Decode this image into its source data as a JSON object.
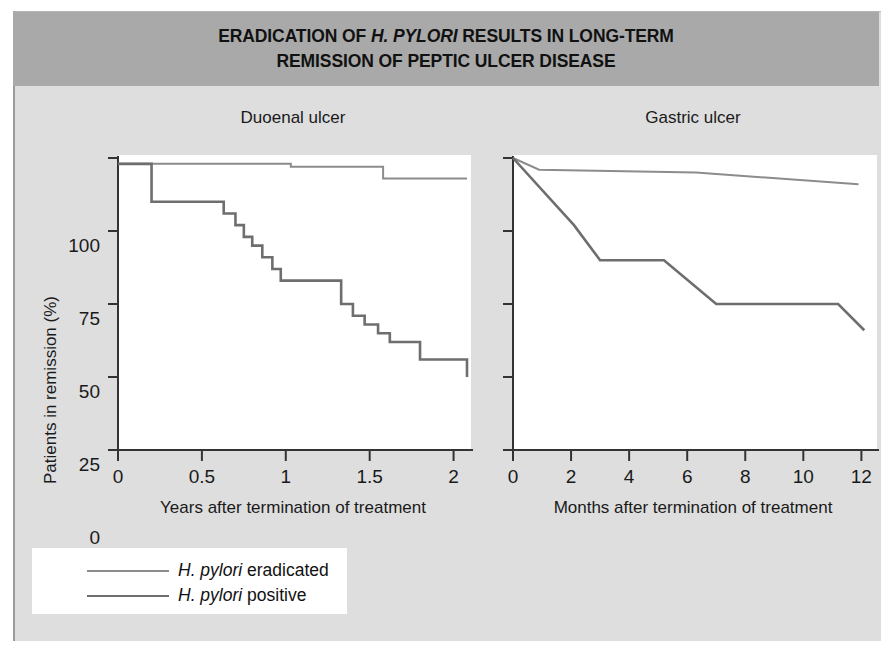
{
  "figure": {
    "title_line1_pre": "ERADICATION OF ",
    "title_line1_italic": "H. PYLORI",
    "title_line1_post": " RESULTS IN LONG-TERM",
    "title_line2": "REMISSION OF PEPTIC ULCER DISEASE",
    "background_color": "#dedede",
    "header_color": "#a9a9a9",
    "plot_background": "#ffffff"
  },
  "legend": {
    "items": [
      {
        "label_italic": "H. pylori",
        "label_rest": " eradicated",
        "color": "#8c8c8c",
        "width": 2
      },
      {
        "label_italic": "H. pylori",
        "label_rest": " positive",
        "color": "#6e6e6e",
        "width": 2.6
      }
    ]
  },
  "chart_data": [
    {
      "type": "line",
      "title": "Duoenal ulcer",
      "xlabel": "Years after termination of treatment",
      "ylabel": "Patients in remission (%)",
      "xlim": [
        0,
        2.08
      ],
      "ylim": [
        0,
        100
      ],
      "xticks": [
        0,
        0.5,
        1,
        1.5,
        2
      ],
      "xticklabels": [
        "0",
        "0.5",
        "1",
        "1.5",
        "2"
      ],
      "yticks": [
        0,
        25,
        50,
        75,
        100
      ],
      "yticklabels": [
        "0",
        "25",
        "50",
        "75",
        "100"
      ],
      "grid": false,
      "step": "post",
      "series": [
        {
          "name": "H. pylori eradicated",
          "color": "#8c8c8c",
          "x": [
            0,
            1.03,
            1.58,
            2.08
          ],
          "y": [
            98,
            97,
            93,
            93
          ]
        },
        {
          "name": "H. pylori positive",
          "color": "#6e6e6e",
          "x": [
            0,
            0.2,
            0.55,
            0.63,
            0.7,
            0.75,
            0.8,
            0.86,
            0.92,
            0.97,
            1.33,
            1.4,
            1.47,
            1.55,
            1.62,
            1.8,
            2.08
          ],
          "y": [
            98,
            85,
            85,
            81,
            77,
            73,
            70,
            66,
            62,
            58,
            50,
            46,
            43,
            40,
            37,
            31,
            25
          ]
        }
      ]
    },
    {
      "type": "line",
      "title": "Gastric ulcer",
      "xlabel": "Months after termination of treatment",
      "ylabel": "Patients in remission (%)",
      "xlim": [
        0,
        12.4
      ],
      "ylim": [
        0,
        100
      ],
      "xticks": [
        0,
        2,
        4,
        6,
        8,
        10,
        12
      ],
      "xticklabels": [
        "0",
        "2",
        "4",
        "6",
        "8",
        "10",
        "12"
      ],
      "yticks": [
        0,
        25,
        50,
        75,
        100
      ],
      "grid": false,
      "step": "none",
      "series": [
        {
          "name": "H. pylori eradicated",
          "color": "#8c8c8c",
          "x": [
            0,
            0.9,
            6.3,
            11.9
          ],
          "y": [
            100,
            96,
            95,
            91
          ]
        },
        {
          "name": "H. pylori positive",
          "color": "#6e6e6e",
          "x": [
            0,
            2.1,
            3.0,
            5.2,
            7.0,
            11.2,
            12.1
          ],
          "y": [
            100,
            77,
            65,
            65,
            50,
            50,
            41
          ]
        }
      ]
    }
  ]
}
